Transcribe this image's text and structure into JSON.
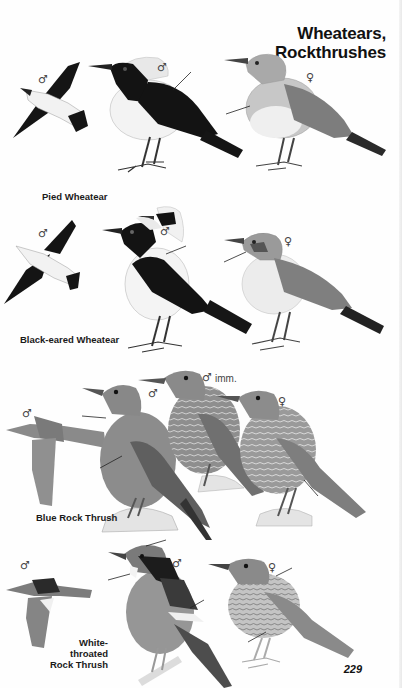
{
  "page": {
    "title_line1": "Wheatears,",
    "title_line2": "Rockthrushes",
    "page_number": "229"
  },
  "species": [
    {
      "name": "Pied Wheatear",
      "labels": {
        "flight": "♂",
        "male": "♂",
        "female": "♀"
      }
    },
    {
      "name": "Black-eared Wheatear",
      "labels": {
        "flight": "♂",
        "male": "♂",
        "female": "♀"
      }
    },
    {
      "name": "Blue Rock Thrush",
      "labels": {
        "flight": "♂",
        "male": "♂",
        "immature": "♂",
        "immature_note": "imm.",
        "female": "♀"
      }
    },
    {
      "name_line1": "White-throated",
      "name_line2": "Rock Thrush",
      "labels": {
        "flight": "♂",
        "male": "♂",
        "female": "♀"
      }
    }
  ],
  "colors": {
    "background": "#fefefe",
    "black_plumage": "#141414",
    "grey_plumage": "#8f8f8f",
    "light_grey": "#c9c9c9",
    "text": "#111111"
  }
}
